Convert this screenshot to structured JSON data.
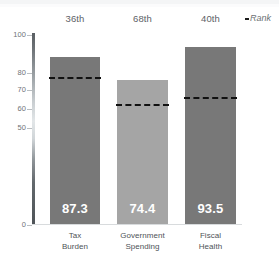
{
  "chart_data": {
    "type": "bar",
    "title": "",
    "subtitle": "",
    "xlabel": "",
    "ylabel": "",
    "categories": [
      "Tax Burden",
      "Government Spending",
      "Fiscal Health"
    ],
    "category_lines": [
      [
        "Tax",
        "Burden"
      ],
      [
        "Government",
        "Spending"
      ],
      [
        "Fiscal",
        "Health"
      ]
    ],
    "values": [
      87.3,
      74.4,
      93.5
    ],
    "value_labels": [
      "87.3",
      "74.4",
      "93.5"
    ],
    "ranks": [
      "36th",
      "68th",
      "40th"
    ],
    "rank_legend": "Rank",
    "reference_series_name": "Rank",
    "reference_values": [
      77.0,
      62.5,
      66.0
    ],
    "bar_colors": [
      "#787878",
      "#a5a5a5",
      "#787878"
    ],
    "reference_line_color": "#111111",
    "ylim": [
      0,
      100
    ],
    "ytick_labels": [
      "100",
      "80",
      "70",
      "60",
      "50",
      "0"
    ],
    "ytick_values": [
      100,
      80,
      70,
      60,
      50,
      0
    ],
    "grid": false,
    "legend_position": "top-right",
    "axis_broken_between": [
      0,
      50
    ]
  },
  "axis": {
    "ticks": [
      {
        "label": "100",
        "top": 31
      },
      {
        "label": "80",
        "top": 69
      },
      {
        "label": "70",
        "top": 86
      },
      {
        "label": "60",
        "top": 105
      },
      {
        "label": "50",
        "top": 124
      },
      {
        "label": "0",
        "top": 221
      }
    ]
  },
  "bars": [
    {
      "name": "tax-burden",
      "value_label": "87.3",
      "rank": "36th",
      "color": "#787878",
      "left": 50,
      "width": 50,
      "top": 57,
      "dash_top": 77,
      "label_line1": "Tax",
      "label_line2": "Burden"
    },
    {
      "name": "government-spending",
      "value_label": "74.4",
      "rank": "68th",
      "color": "#a5a5a5",
      "left": 117,
      "width": 51,
      "top": 80,
      "dash_top": 104,
      "label_line1": "Government",
      "label_line2": "Spending"
    },
    {
      "name": "fiscal-health",
      "value_label": "93.5",
      "rank": "40th",
      "color": "#787878",
      "left": 185,
      "width": 51,
      "top": 47,
      "dash_top": 97,
      "label_line1": "Fiscal",
      "label_line2": "Health"
    }
  ]
}
